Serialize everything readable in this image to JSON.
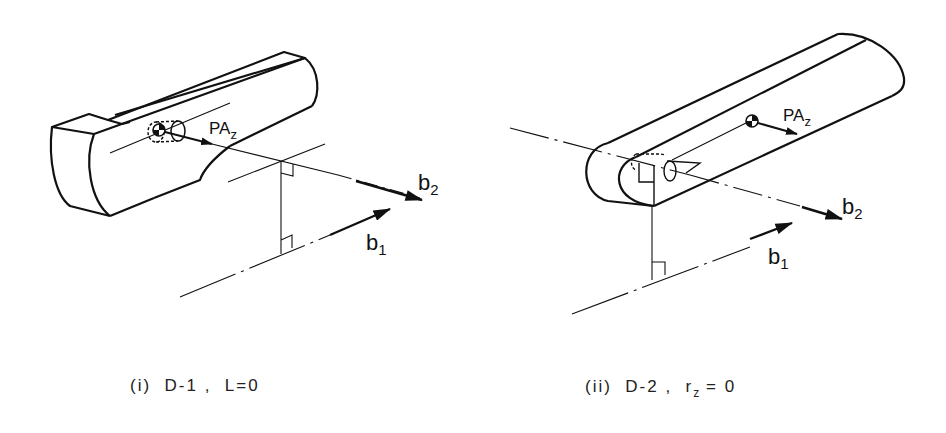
{
  "figures": [
    {
      "id": "i",
      "caption": "(i)  D-1 ,  L=0",
      "labels": {
        "force": "PA",
        "force_sub": "z",
        "vector1": "b",
        "vector1_sub": "1",
        "vector2": "b",
        "vector2_sub": "2"
      }
    },
    {
      "id": "ii",
      "caption_main": "(ii)  D-2 ,  r",
      "caption_sub": "z",
      "caption_tail": " = 0",
      "labels": {
        "force": "PA",
        "force_sub": "z",
        "vector1": "b",
        "vector1_sub": "1",
        "vector2": "b",
        "vector2_sub": "2"
      }
    }
  ],
  "colors": {
    "ink": "#111111",
    "background": "#ffffff"
  }
}
